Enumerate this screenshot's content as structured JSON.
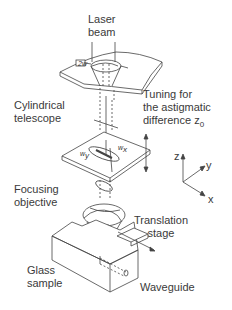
{
  "labels": {
    "laser_beam_1": "Laser",
    "laser_beam_2": "beam",
    "cylindrical_1": "Cylindrical",
    "cylindrical_2": "telescope",
    "tuning_1": "Tuning for",
    "tuning_2": "the astigmatic",
    "tuning_3": "difference z",
    "tuning_sub": "0",
    "focusing_1": "Focusing",
    "focusing_2": "objective",
    "translation_1": "Translation",
    "translation_2": "stage",
    "glass_1": "Glass",
    "glass_2": "sample",
    "waveguide": "Waveguide"
  },
  "symbols": {
    "two_w": "2w",
    "w_y": "w",
    "w_y_sub": "y",
    "w_x": "w",
    "w_x_sub": "x"
  },
  "axes": {
    "z": "z",
    "y": "y",
    "x": "x"
  },
  "colors": {
    "line": "#444444",
    "text": "#3a3a3a"
  }
}
